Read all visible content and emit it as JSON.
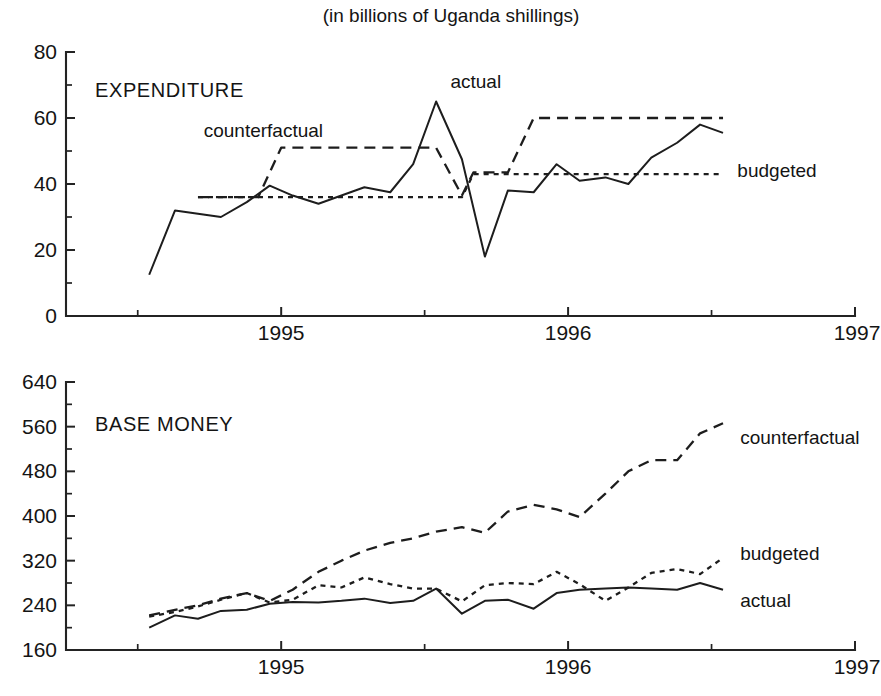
{
  "figure": {
    "title": "(in billions of Uganda shillings)",
    "width": 881,
    "height": 696
  },
  "chart_data": [
    {
      "type": "line",
      "title": "EXPENDITURE",
      "subtitle": "(in billions of Uganda shillings)",
      "xlabel": "",
      "ylabel": "",
      "xlim": [
        1994.25,
        1997.0
      ],
      "ylim": [
        0,
        80
      ],
      "grid": false,
      "legend_position": "inline-annotations",
      "xticks": [
        1995,
        1996,
        1997
      ],
      "xticklabels": [
        "1995",
        "1996",
        "1997"
      ],
      "xminorticks": [
        1994.5,
        1995.5,
        1996.5
      ],
      "yticks": [
        0,
        20,
        40,
        60,
        80
      ],
      "yticklabels": [
        "0",
        "20",
        "40",
        "60",
        "80"
      ],
      "yminorticks": [
        10,
        30,
        50,
        70
      ],
      "series": [
        {
          "name": "actual",
          "style": "solid",
          "label_x": 1995.59,
          "label_y": 71,
          "x": [
            1994.54,
            1994.63,
            1994.71,
            1994.79,
            1994.88,
            1994.96,
            1995.04,
            1995.13,
            1995.21,
            1995.29,
            1995.38,
            1995.46,
            1995.54,
            1995.63,
            1995.71,
            1995.79,
            1995.88,
            1995.96,
            1996.04,
            1996.13,
            1996.21,
            1996.29,
            1996.38,
            1996.46,
            1996.54
          ],
          "y": [
            12.5,
            32.0,
            31.0,
            30.0,
            34.5,
            39.5,
            36.5,
            34.0,
            36.5,
            39.0,
            37.5,
            46.0,
            65.0,
            47.5,
            18.0,
            38.0,
            37.5,
            46.0,
            41.0,
            42.0,
            40.0,
            48.0,
            52.5,
            58.0,
            55.5
          ]
        },
        {
          "name": "counterfactual",
          "style": "dashed-long",
          "label_x": 1994.73,
          "label_y": 56,
          "x": [
            1994.71,
            1994.92,
            1995.0,
            1995.54,
            1995.63,
            1995.67,
            1995.79,
            1995.88,
            1996.54
          ],
          "y": [
            36.0,
            36.0,
            51.0,
            51.0,
            36.5,
            43.5,
            43.5,
            60.0,
            60.0
          ]
        },
        {
          "name": "budgeted",
          "style": "dotted-short",
          "label_x": 1996.59,
          "label_y": 44,
          "x": [
            1994.71,
            1995.63,
            1995.67,
            1996.54
          ],
          "y": [
            36.0,
            36.0,
            43.0,
            43.0
          ]
        }
      ]
    },
    {
      "type": "line",
      "title": "BASE MONEY",
      "subtitle": "",
      "xlabel": "",
      "ylabel": "",
      "xlim": [
        1994.25,
        1997.0
      ],
      "ylim": [
        160,
        640
      ],
      "grid": false,
      "legend_position": "inline-annotations",
      "xticks": [
        1995,
        1996,
        1997
      ],
      "xticklabels": [
        "1995",
        "1996",
        "1997"
      ],
      "xminorticks": [
        1994.5,
        1995.5,
        1996.5
      ],
      "yticks": [
        160,
        240,
        320,
        400,
        480,
        560,
        640
      ],
      "yticklabels": [
        "160",
        "240",
        "320",
        "400",
        "480",
        "560",
        "640"
      ],
      "yminorticks": [
        200,
        280,
        360,
        440,
        520,
        600
      ],
      "series": [
        {
          "name": "counterfactual",
          "style": "dashed-long",
          "label_x": 1996.6,
          "label_y": 540,
          "x": [
            1994.54,
            1994.63,
            1994.71,
            1994.79,
            1994.88,
            1994.96,
            1995.04,
            1995.13,
            1995.21,
            1995.29,
            1995.38,
            1995.46,
            1995.54,
            1995.63,
            1995.71,
            1995.79,
            1995.88,
            1995.96,
            1996.04,
            1996.13,
            1996.21,
            1996.29,
            1996.38,
            1996.46,
            1996.54
          ],
          "y": [
            222,
            232,
            240,
            252,
            262,
            248,
            268,
            300,
            320,
            338,
            352,
            360,
            372,
            380,
            370,
            408,
            420,
            412,
            398,
            440,
            480,
            500,
            500,
            548,
            566,
            562,
            530
          ]
        },
        {
          "name": "budgeted",
          "style": "dotted-short",
          "label_x": 1996.6,
          "label_y": 332,
          "x": [
            1994.54,
            1994.63,
            1994.71,
            1994.79,
            1994.88,
            1994.96,
            1995.04,
            1995.13,
            1995.21,
            1995.29,
            1995.38,
            1995.46,
            1995.54,
            1995.63,
            1995.71,
            1995.79,
            1995.88,
            1995.96,
            1996.04,
            1996.13,
            1996.21,
            1996.29,
            1996.38,
            1996.46,
            1996.54
          ],
          "y": [
            220,
            228,
            238,
            250,
            262,
            245,
            250,
            276,
            272,
            290,
            278,
            270,
            270,
            247,
            276,
            280,
            278,
            300,
            278,
            248,
            272,
            298,
            305,
            296,
            325,
            312,
            300
          ]
        },
        {
          "name": "actual",
          "style": "solid",
          "label_x": 1996.6,
          "label_y": 248,
          "x": [
            1994.54,
            1994.63,
            1994.71,
            1994.79,
            1994.88,
            1994.96,
            1995.04,
            1995.13,
            1995.21,
            1995.29,
            1995.38,
            1995.46,
            1995.54,
            1995.63,
            1995.71,
            1995.79,
            1995.88,
            1995.96,
            1996.04,
            1996.13,
            1996.21,
            1996.29,
            1996.38,
            1996.46,
            1996.54
          ],
          "y": [
            200,
            222,
            216,
            230,
            232,
            243,
            246,
            245,
            248,
            252,
            244,
            248,
            270,
            225,
            248,
            250,
            234,
            262,
            268,
            270,
            272,
            270,
            268,
            280,
            268
          ]
        }
      ]
    }
  ]
}
